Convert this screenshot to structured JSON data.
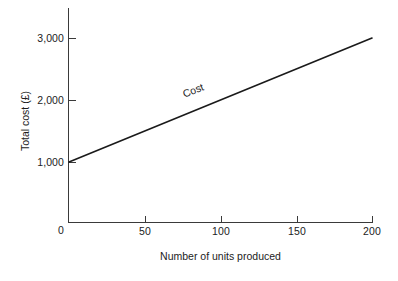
{
  "chart_data": {
    "type": "line",
    "title": "",
    "xlabel": "Number of units produced",
    "ylabel": "Total cost (£)",
    "xlim": [
      0,
      200
    ],
    "ylim": [
      0,
      3000
    ],
    "grid": false,
    "legend": "none",
    "origin_label": "0",
    "xticks": [
      50,
      100,
      150,
      200
    ],
    "xticklabels": [
      "50",
      "100",
      "150",
      "200"
    ],
    "yticks": [
      1000,
      2000,
      3000
    ],
    "yticklabels": [
      "1,000",
      "2,000",
      "3,000"
    ],
    "series": [
      {
        "name": "Cost",
        "x": [
          0,
          200
        ],
        "values": [
          1000,
          3000
        ],
        "color": "#1a1a1a",
        "annotation": "Cost",
        "annotation_x": 95,
        "annotation_y": 2050
      }
    ]
  },
  "figure": {
    "background": "#ffffff",
    "axis_color": "#3a3a3a",
    "text_color": "#1c1c1c"
  }
}
